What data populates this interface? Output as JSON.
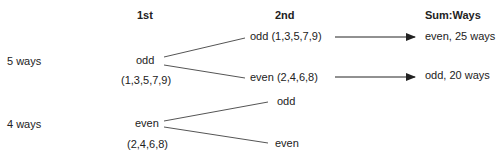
{
  "headers": {
    "first": "1st",
    "second": "2nd",
    "sum": "Sum:Ways"
  },
  "rows": [
    {
      "ways_label": "5 ways",
      "first_parity": "odd",
      "first_digits": "(1,3,5,7,9)",
      "branches": [
        {
          "second": "odd  (1,3,5,7,9)",
          "result": "even, 25 ways"
        },
        {
          "second": "even  (2,4,6,8)",
          "result": "odd, 20 ways"
        }
      ]
    },
    {
      "ways_label": "4 ways",
      "first_parity": "even",
      "first_digits": "(2,4,6,8)",
      "branches": [
        {
          "second": "odd"
        },
        {
          "second": "even"
        }
      ]
    }
  ],
  "colors": {
    "line": "#555555",
    "text": "#222222"
  }
}
